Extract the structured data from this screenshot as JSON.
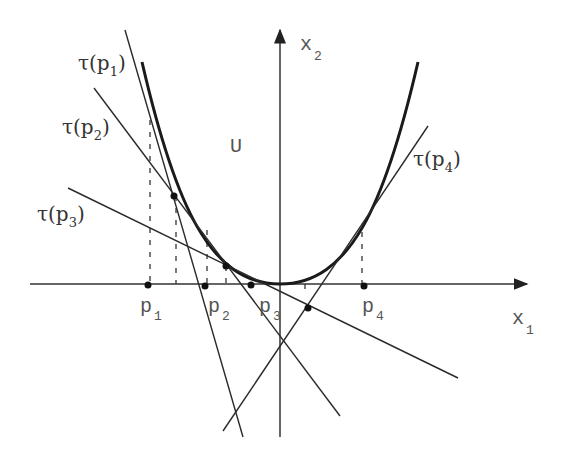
{
  "figure": {
    "region_label": "U",
    "axes": {
      "x_label": "x",
      "x_sub": "1",
      "y_label": "x",
      "y_sub": "2"
    },
    "points": [
      {
        "name": "p",
        "sub": "1"
      },
      {
        "name": "p",
        "sub": "2"
      },
      {
        "name": "p",
        "sub": "3"
      },
      {
        "name": "p",
        "sub": "4"
      }
    ],
    "tangents": [
      {
        "prefix": "τ(p",
        "sub": "1",
        "suffix": ")"
      },
      {
        "prefix": "τ(p",
        "sub": "2",
        "suffix": ")"
      },
      {
        "prefix": "τ(p",
        "sub": "3",
        "suffix": ")"
      },
      {
        "prefix": "τ(p",
        "sub": "4",
        "suffix": ")"
      }
    ],
    "colors": {
      "curve": "#1a1a1a",
      "line": "#2a2a2a",
      "text": "#555555"
    }
  }
}
